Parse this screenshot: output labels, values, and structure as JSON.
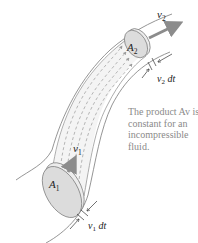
{
  "diagram": {
    "labels": {
      "a2": "A",
      "a2_sub": "2",
      "a1": "A",
      "a1_sub": "1",
      "v2": "v",
      "v2_sub": "2",
      "v1": "v",
      "v1_sub": "1",
      "v2dt_v": "v",
      "v2dt_sub": "2",
      "v2dt_dt": " dt",
      "v1dt_v": "v",
      "v1dt_sub": "1",
      "v1dt_dt": " dt"
    },
    "caption": {
      "line1": "The product Av is",
      "line2": "constant for an",
      "line3": "incompressible",
      "line4": "fluid."
    },
    "colors": {
      "tube_outline": "#7a7a7a",
      "disk_fill": "#dcdcdc",
      "disk_rim": "#ececec",
      "arrow": "#8c8c8c",
      "streamline": "#9a9a9a",
      "caption_text": "#8a8a8a",
      "label_text": "#222222"
    }
  }
}
